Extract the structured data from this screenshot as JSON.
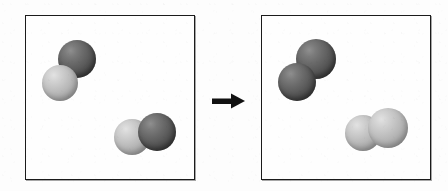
{
  "figure": {
    "type": "chemical-reaction-diagram",
    "title": "Molecular rearrangement: 2 AB → A₂ + B₂",
    "background_color": "#fdfdfd",
    "border_color": "#1b1b1b",
    "dark_atom_color": "#575757",
    "light_atom_color": "#b2b2b2"
  },
  "arrow": {
    "name": "reaction-arrow",
    "direction": "right",
    "glyph": "→",
    "color": "#111111",
    "x": 212,
    "y": 93,
    "width": 33,
    "height": 16
  },
  "panels": [
    {
      "id": "reactants",
      "label": "Reactants panel",
      "x": 25,
      "y": 15,
      "width": 170,
      "height": 165,
      "molecules": [
        {
          "name": "molecule-ab-upper-left",
          "formula": "AB",
          "atoms": [
            {
              "name": "atom-dark",
              "shade": "dark",
              "cx": 77,
              "cy": 59,
              "r": 19
            },
            {
              "name": "atom-light",
              "shade": "light",
              "cx": 60,
              "cy": 83,
              "r": 18
            }
          ]
        },
        {
          "name": "molecule-ab-lower-right",
          "formula": "AB",
          "atoms": [
            {
              "name": "atom-light",
              "shade": "light",
              "cx": 132,
              "cy": 137,
              "r": 18
            },
            {
              "name": "atom-dark",
              "shade": "dark",
              "cx": 157,
              "cy": 132,
              "r": 19
            }
          ]
        }
      ]
    },
    {
      "id": "products",
      "label": "Products panel",
      "x": 261,
      "y": 15,
      "width": 170,
      "height": 165,
      "molecules": [
        {
          "name": "molecule-b2-upper-left",
          "formula": "B₂",
          "atoms": [
            {
              "name": "atom-dark",
              "shade": "dark",
              "cx": 316,
              "cy": 59,
              "r": 20
            },
            {
              "name": "atom-dark",
              "shade": "dark",
              "cx": 297,
              "cy": 82,
              "r": 19
            }
          ]
        },
        {
          "name": "molecule-a2-lower-right",
          "formula": "A₂",
          "atoms": [
            {
              "name": "atom-light",
              "shade": "light",
              "cx": 363,
              "cy": 133,
              "r": 18
            },
            {
              "name": "atom-light",
              "shade": "light",
              "cx": 388,
              "cy": 128,
              "r": 20
            }
          ]
        }
      ]
    }
  ]
}
